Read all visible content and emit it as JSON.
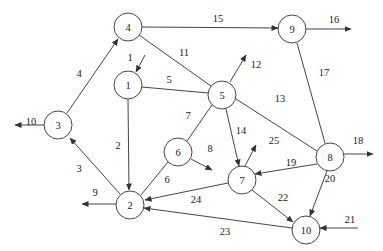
{
  "diagram": {
    "type": "directed network graph",
    "nodes": [
      {
        "id": "1",
        "label": "1",
        "x": 128,
        "y": 85
      },
      {
        "id": "2",
        "label": "2",
        "x": 130,
        "y": 205
      },
      {
        "id": "3",
        "label": "3",
        "x": 58,
        "y": 125
      },
      {
        "id": "4",
        "label": "4",
        "x": 128,
        "y": 27
      },
      {
        "id": "5",
        "label": "5",
        "x": 222,
        "y": 95
      },
      {
        "id": "6",
        "label": "6",
        "x": 178,
        "y": 152
      },
      {
        "id": "7",
        "label": "7",
        "x": 242,
        "y": 180
      },
      {
        "id": "8",
        "label": "8",
        "x": 330,
        "y": 157
      },
      {
        "id": "9",
        "label": "9",
        "x": 292,
        "y": 29
      },
      {
        "id": "10",
        "label": "10",
        "x": 306,
        "y": 230
      }
    ],
    "edges": [
      {
        "label": "1",
        "from": null,
        "to": "1",
        "x1": 145,
        "y1": 55,
        "x2": 136,
        "y2": 72,
        "arrow": true,
        "lx": 130,
        "ly": 57
      },
      {
        "label": "2",
        "from": "1",
        "to": "2",
        "x1": 128,
        "y1": 99,
        "x2": 129,
        "y2": 190,
        "arrow": true,
        "lx": 118,
        "ly": 145
      },
      {
        "label": "3",
        "from": "2",
        "to": "3",
        "x1": 120,
        "y1": 194,
        "x2": 70,
        "y2": 138,
        "arrow": true,
        "lx": 79,
        "ly": 168
      },
      {
        "label": "4",
        "from": "3",
        "to": "4",
        "x1": 67,
        "y1": 113,
        "x2": 118,
        "y2": 39,
        "arrow": true,
        "lx": 79,
        "ly": 73
      },
      {
        "label": "5",
        "from": "1",
        "to": "5",
        "x1": 142,
        "y1": 87,
        "x2": 208,
        "y2": 93,
        "arrow": false,
        "lx": 169,
        "ly": 79
      },
      {
        "label": "6",
        "from": "6",
        "to": "2",
        "x1": 168,
        "y1": 162,
        "x2": 141,
        "y2": 195,
        "arrow": false,
        "lx": 167,
        "ly": 179
      },
      {
        "label": "7",
        "from": "5",
        "to": "6",
        "x1": 212,
        "y1": 105,
        "x2": 187,
        "y2": 141,
        "arrow": false,
        "lx": 188,
        "ly": 115
      },
      {
        "label": "8",
        "from": "6",
        "to": null,
        "x1": 191,
        "y1": 159,
        "x2": 212,
        "y2": 170,
        "arrow": true,
        "lx": 210,
        "ly": 148
      },
      {
        "label": "9",
        "from": "2",
        "to": null,
        "x1": 116,
        "y1": 204,
        "x2": 82,
        "y2": 204,
        "arrow": true,
        "lx": 95,
        "ly": 192
      },
      {
        "label": "10",
        "from": "3",
        "to": null,
        "x1": 44,
        "y1": 125,
        "x2": 15,
        "y2": 125,
        "arrow": true,
        "lx": 31,
        "ly": 121
      },
      {
        "label": "11",
        "from": "4",
        "to": "5",
        "x1": 139,
        "y1": 35,
        "x2": 211,
        "y2": 86,
        "arrow": false,
        "lx": 184,
        "ly": 52
      },
      {
        "label": "12",
        "from": "5",
        "to": null,
        "x1": 230,
        "y1": 82,
        "x2": 246,
        "y2": 55,
        "arrow": true,
        "lx": 256,
        "ly": 64
      },
      {
        "label": "13",
        "from": "5",
        "to": "8",
        "x1": 236,
        "y1": 99,
        "x2": 317,
        "y2": 151,
        "arrow": false,
        "lx": 280,
        "ly": 98
      },
      {
        "label": "14",
        "from": "5",
        "to": "7",
        "x1": 226,
        "y1": 109,
        "x2": 239,
        "y2": 166,
        "arrow": true,
        "lx": 241,
        "ly": 130
      },
      {
        "label": "15",
        "from": "4",
        "to": "9",
        "x1": 142,
        "y1": 27,
        "x2": 278,
        "y2": 28,
        "arrow": true,
        "lx": 218,
        "ly": 18
      },
      {
        "label": "16",
        "from": "9",
        "to": null,
        "x1": 306,
        "y1": 29,
        "x2": 351,
        "y2": 29,
        "arrow": true,
        "lx": 334,
        "ly": 19
      },
      {
        "label": "17",
        "from": "9",
        "to": "8",
        "x1": 297,
        "y1": 43,
        "x2": 325,
        "y2": 143,
        "arrow": false,
        "lx": 324,
        "ly": 72
      },
      {
        "label": "18",
        "from": "8",
        "to": null,
        "x1": 344,
        "y1": 154,
        "x2": 373,
        "y2": 154,
        "arrow": true,
        "lx": 358,
        "ly": 140
      },
      {
        "label": "19",
        "from": "8",
        "to": "7",
        "x1": 317,
        "y1": 164,
        "x2": 255,
        "y2": 174,
        "arrow": true,
        "lx": 291,
        "ly": 162
      },
      {
        "label": "20",
        "from": "8",
        "to": "10",
        "x1": 327,
        "y1": 171,
        "x2": 310,
        "y2": 216,
        "arrow": true,
        "lx": 330,
        "ly": 178
      },
      {
        "label": "21",
        "from": null,
        "to": "10",
        "x1": 358,
        "y1": 228,
        "x2": 320,
        "y2": 228,
        "arrow": true,
        "lx": 350,
        "ly": 219
      },
      {
        "label": "22",
        "from": "7",
        "to": "10",
        "x1": 252,
        "y1": 190,
        "x2": 293,
        "y2": 222,
        "arrow": true,
        "lx": 283,
        "ly": 197
      },
      {
        "label": "23",
        "from": "10",
        "to": "2",
        "x1": 292,
        "y1": 228,
        "x2": 144,
        "y2": 208,
        "arrow": true,
        "lx": 225,
        "ly": 231
      },
      {
        "label": "24",
        "from": "7",
        "to": "2",
        "x1": 228,
        "y1": 183,
        "x2": 145,
        "y2": 200,
        "arrow": true,
        "lx": 196,
        "ly": 199
      },
      {
        "label": "25",
        "from": "7",
        "to": null,
        "x1": 245,
        "y1": 166,
        "x2": 256,
        "y2": 145,
        "arrow": true,
        "lx": 274,
        "ly": 140
      }
    ]
  }
}
